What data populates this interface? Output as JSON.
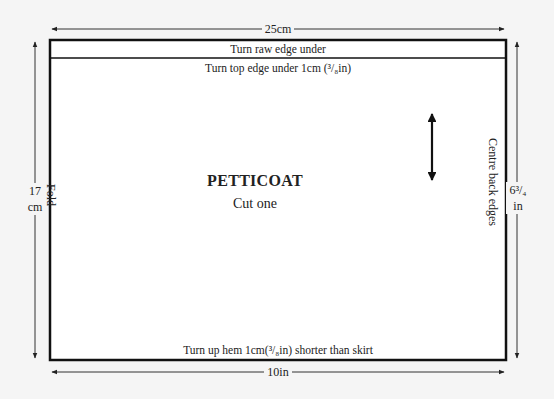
{
  "pattern": {
    "title": "PETTICOAT",
    "subtitle": "Cut one",
    "top_band_label": "Turn raw edge under",
    "top_edge_instruction": "Turn top edge under 1cm (³/₈in)",
    "hem_instruction": "Turn up hem 1cm(³/₈in) shorter than skirt",
    "left_edge_label": "Fold",
    "right_edge_label": "Centre back edges",
    "grainline": "double-headed-arrow"
  },
  "dimensions": {
    "width_cm": "25cm",
    "width_in": "10in",
    "height_cm_value": "17",
    "height_cm_unit": "cm",
    "height_in_value": "6³/₄",
    "height_in_unit": "in"
  },
  "colors": {
    "background": "#f5f5f5",
    "piece_fill": "#ffffff",
    "line": "#111111"
  }
}
